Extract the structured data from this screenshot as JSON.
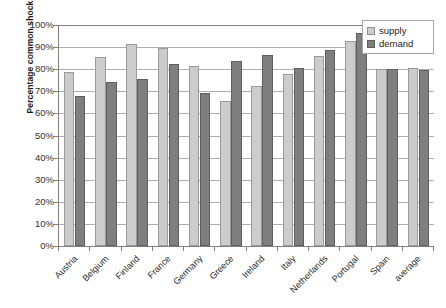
{
  "chart_data": {
    "type": "bar",
    "title": "",
    "xlabel": "",
    "ylabel": "Percentage common shock",
    "ylim": [
      0,
      100
    ],
    "ytick_labels": [
      "100%",
      "90%",
      "80%",
      "70%",
      "60%",
      "50%",
      "40%",
      "30%",
      "20%",
      "10%",
      "0%"
    ],
    "ytick_values": [
      100,
      90,
      80,
      70,
      60,
      50,
      40,
      30,
      20,
      10,
      0
    ],
    "grid": true,
    "legend_position": "top-right",
    "categories": [
      "Austria",
      "Belgium",
      "Finland",
      "France",
      "Germany",
      "Greece",
      "Ireland",
      "Italy",
      "Netherlands",
      "Portugal",
      "Spain",
      "average"
    ],
    "series": [
      {
        "name": "supply",
        "color": "#cccccc",
        "values": [
          78.7,
          85.5,
          91.5,
          89.5,
          81.3,
          65.5,
          72.5,
          78.0,
          86.0,
          92.8,
          80.0,
          80.5
        ]
      },
      {
        "name": "demand",
        "color": "#7f7f7f",
        "values": [
          68.0,
          74.0,
          75.5,
          82.5,
          69.3,
          83.5,
          86.5,
          80.5,
          88.5,
          96.5,
          80.0,
          79.5
        ]
      }
    ]
  },
  "legend": {
    "items": [
      {
        "label": "supply",
        "swatch": "supply"
      },
      {
        "label": "demand",
        "swatch": "demand"
      }
    ]
  },
  "axis": {
    "y_title": "Percentage common shock"
  }
}
